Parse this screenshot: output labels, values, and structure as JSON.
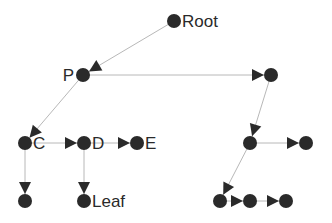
{
  "diagram": {
    "type": "tree",
    "colors": {
      "node": "#2a2a2a",
      "edge": "#b8b8b8",
      "arrow": "#2a2a2a",
      "background": "#ffffff"
    },
    "nodes": [
      {
        "id": "root",
        "label": "Root",
        "x": 174,
        "y": 21,
        "label_side": "right"
      },
      {
        "id": "p",
        "label": "P",
        "x": 83,
        "y": 75,
        "label_side": "left"
      },
      {
        "id": "r1",
        "label": "",
        "x": 271,
        "y": 75
      },
      {
        "id": "c",
        "label": "C",
        "x": 25,
        "y": 143,
        "label_side": "right"
      },
      {
        "id": "d",
        "label": "D",
        "x": 84,
        "y": 143,
        "label_side": "right"
      },
      {
        "id": "e",
        "label": "E",
        "x": 137,
        "y": 143,
        "label_side": "right"
      },
      {
        "id": "r2",
        "label": "",
        "x": 250,
        "y": 143
      },
      {
        "id": "r3",
        "label": "",
        "x": 306,
        "y": 143
      },
      {
        "id": "cl",
        "label": "",
        "x": 25,
        "y": 201
      },
      {
        "id": "leaf",
        "label": "Leaf",
        "x": 84,
        "y": 201,
        "label_side": "right"
      },
      {
        "id": "b1",
        "label": "",
        "x": 220,
        "y": 201
      },
      {
        "id": "b2",
        "label": "",
        "x": 250,
        "y": 201
      },
      {
        "id": "b3",
        "label": "",
        "x": 286,
        "y": 201
      }
    ],
    "edges": [
      {
        "from": "root",
        "to": "p"
      },
      {
        "from": "p",
        "to": "r1"
      },
      {
        "from": "p",
        "to": "c"
      },
      {
        "from": "c",
        "to": "d"
      },
      {
        "from": "d",
        "to": "e"
      },
      {
        "from": "c",
        "to": "cl"
      },
      {
        "from": "d",
        "to": "leaf"
      },
      {
        "from": "r1",
        "to": "r2"
      },
      {
        "from": "r2",
        "to": "r3"
      },
      {
        "from": "r2",
        "to": "b1"
      },
      {
        "from": "b1",
        "to": "b2"
      },
      {
        "from": "b2",
        "to": "b3"
      }
    ]
  }
}
